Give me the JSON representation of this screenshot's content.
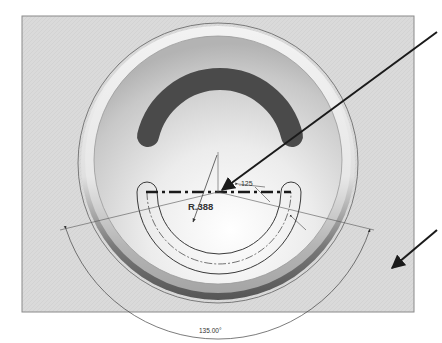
{
  "figure": {
    "type": "cad-sketch-illustration"
  },
  "colors": {
    "background": "#ffffff",
    "sketch_plane": "#d9d9d9",
    "plane_border": "#8a8a8a",
    "slot_fill": "#4a4a4a",
    "dimension_line": "#444444",
    "callout_arrow": "#1a1a1a"
  },
  "dimensions": {
    "radius_label": "R.388",
    "width_label": ".125",
    "angle_label": "135.00°"
  },
  "callouts": [
    {
      "name": "callout-arrow-centerline",
      "target": "slot centerline"
    },
    {
      "name": "callout-arrow-plane",
      "target": "sketch plane"
    }
  ]
}
